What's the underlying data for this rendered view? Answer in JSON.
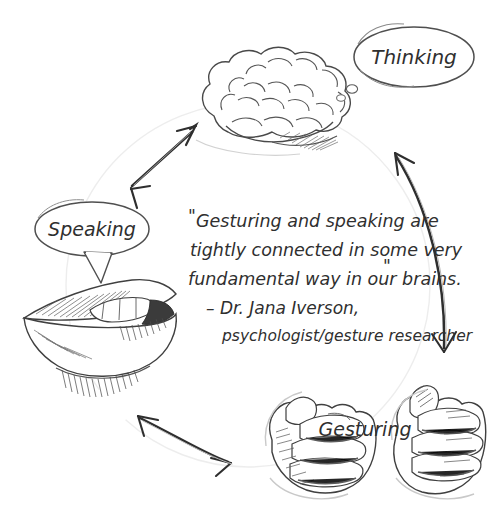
{
  "diagram": {
    "background_color": "#ffffff",
    "ink_color": "#3a3a3a",
    "faint_ink_color": "#bdbdbd",
    "nodes": [
      {
        "id": "thinking",
        "label": "Thinking",
        "icon": "brain-sketch",
        "bubble_type": "thought",
        "position": "top"
      },
      {
        "id": "speaking",
        "label": "Speaking",
        "icon": "mouth-lips-sketch",
        "bubble_type": "speech",
        "position": "left"
      },
      {
        "id": "gesturing",
        "label": "Gesturing",
        "icon": "two-hands-sketch",
        "bubble_type": "none",
        "position": "bottom-right"
      }
    ],
    "arrows": [
      {
        "id": "speaking-thinking",
        "from": "speaking",
        "to": "thinking",
        "double_headed": true
      },
      {
        "id": "thinking-gesturing",
        "from": "thinking",
        "to": "gesturing",
        "double_headed": true
      },
      {
        "id": "gesturing-speaking",
        "from": "gesturing",
        "to": "speaking",
        "double_headed": true
      }
    ],
    "quote": {
      "open_mark": "\"",
      "close_mark": "\"",
      "lines": [
        "Gesturing and speaking are",
        "tightly connected in some very",
        "fundamental way in our brains."
      ],
      "attribution": [
        "– Dr. Jana Iverson,",
        "psychologist/gesture researcher"
      ]
    }
  }
}
